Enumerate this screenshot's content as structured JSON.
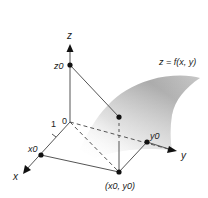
{
  "diagram": {
    "surface_label": "z = f(x, y)",
    "axes": {
      "x": {
        "label": "x",
        "tick_label": "1",
        "point_label": "x0"
      },
      "y": {
        "label": "y",
        "point_label": "y0"
      },
      "z": {
        "label": "z",
        "point_label": "z0"
      }
    },
    "origin_label": "0",
    "base_point_label": "(x0, y0)",
    "points": [
      {
        "name": "z0",
        "on": "z-axis"
      },
      {
        "name": "x0",
        "on": "x-axis"
      },
      {
        "name": "y0",
        "on": "y-axis"
      },
      {
        "name": "(x0, y0)",
        "on": "xy-plane"
      },
      {
        "name": "(x0, y0, f(x0, y0))",
        "on": "surface"
      }
    ],
    "colors": {
      "line": "#555555",
      "point": "#111111",
      "surface_dark": "#9a9a9a",
      "surface_light": "#f2f2f2"
    }
  }
}
